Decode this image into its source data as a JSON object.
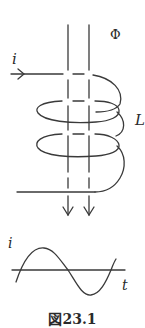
{
  "figure": {
    "caption": "図23.1",
    "labels": {
      "current": "i",
      "flux": "Φ",
      "inductance": "L",
      "graph_y": "i",
      "graph_x": "t"
    },
    "line_color": "#3a3a3a"
  }
}
